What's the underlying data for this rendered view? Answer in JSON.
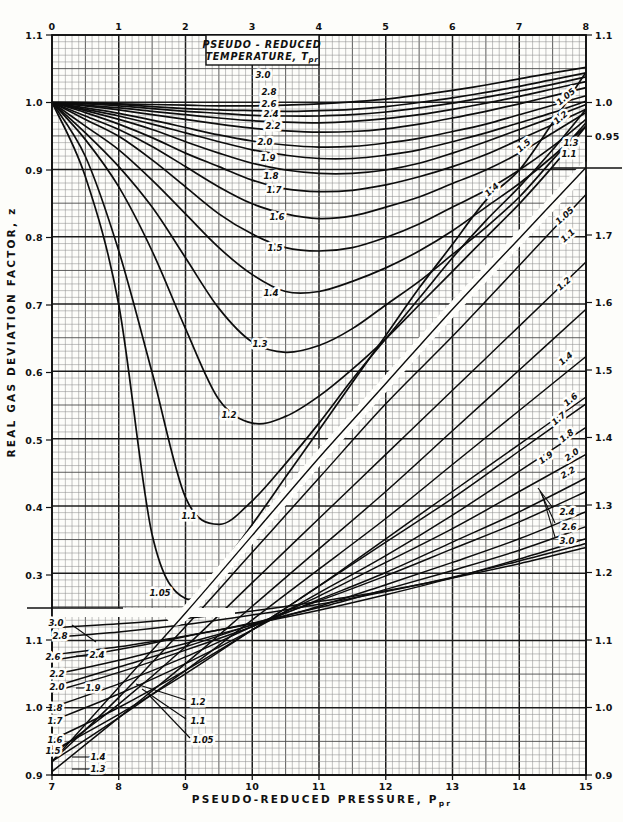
{
  "figure": {
    "x_axis_title": {
      "main": "PSEUDO-REDUCED  PRESSURE,  P",
      "sub": "pr"
    },
    "y_axis_title": "REAL  GAS  DEVIATION  FACTOR,  z",
    "legend_box": {
      "line1": "PSEUDO - REDUCED",
      "line2_main": "TEMPERATURE, T",
      "line2_sub": "pr"
    }
  },
  "axes": {
    "top_ticks": [
      0,
      1,
      2,
      3,
      4,
      5,
      6,
      7,
      8
    ],
    "bottom_ticks": [
      7,
      8,
      9,
      10,
      11,
      12,
      13,
      14,
      15
    ],
    "left_main": [
      1.1,
      1.0,
      0.9,
      0.8,
      0.7,
      0.6,
      0.5,
      0.4,
      0.3
    ],
    "left_insert": [
      1.1,
      1.0,
      0.9
    ],
    "right_main": [
      1.1,
      1.0,
      0.95
    ],
    "right_insert": [
      1.7,
      1.6,
      1.5,
      1.4,
      1.3,
      1.2,
      1.1,
      1.0,
      0.9
    ],
    "main_x_range": [
      0,
      8
    ],
    "insert_x_range": [
      7,
      15
    ],
    "main_z_top": 1.1,
    "insert_z_bottom": 0.9
  },
  "chart_data": [
    {
      "type": "line",
      "name": "main",
      "title": "Real gas deviation factor z vs pseudo-reduced pressure (Ppr 0-8)",
      "x": [
        0,
        0.5,
        1,
        1.5,
        2,
        2.5,
        3,
        3.5,
        4,
        4.5,
        5,
        5.5,
        6,
        6.5,
        7,
        7.5,
        8
      ],
      "series": [
        {
          "name": "3.0",
          "values": [
            1.0,
            1.0,
            0.998,
            0.997,
            0.996,
            0.995,
            0.995,
            0.996,
            0.998,
            1.001,
            1.005,
            1.011,
            1.018,
            1.026,
            1.035,
            1.044,
            1.052
          ]
        },
        {
          "name": "2.8",
          "values": [
            1.0,
            0.999,
            0.997,
            0.994,
            0.991,
            0.989,
            0.988,
            0.987,
            0.988,
            0.99,
            0.994,
            1.0,
            1.007,
            1.015,
            1.024,
            1.034,
            1.044
          ]
        },
        {
          "name": "2.6",
          "values": [
            1.0,
            0.998,
            0.995,
            0.991,
            0.987,
            0.984,
            0.981,
            0.98,
            0.98,
            0.982,
            0.986,
            0.992,
            0.999,
            1.008,
            1.017,
            1.027,
            1.038
          ]
        },
        {
          "name": "2.4",
          "values": [
            1.0,
            0.996,
            0.992,
            0.987,
            0.982,
            0.977,
            0.973,
            0.971,
            0.97,
            0.972,
            0.976,
            0.982,
            0.99,
            0.999,
            1.009,
            1.02,
            1.031
          ]
        },
        {
          "name": "2.2",
          "values": [
            1.0,
            0.995,
            0.989,
            0.982,
            0.975,
            0.968,
            0.962,
            0.958,
            0.956,
            0.957,
            0.961,
            0.968,
            0.977,
            0.987,
            0.998,
            1.01,
            1.022
          ]
        },
        {
          "name": "2.0",
          "values": [
            1.0,
            0.992,
            0.984,
            0.974,
            0.963,
            0.952,
            0.943,
            0.937,
            0.934,
            0.935,
            0.94,
            0.947,
            0.957,
            0.968,
            0.982,
            0.996,
            1.01
          ]
        },
        {
          "name": "1.9",
          "values": [
            1.0,
            0.99,
            0.98,
            0.968,
            0.955,
            0.942,
            0.93,
            0.922,
            0.917,
            0.917,
            0.922,
            0.93,
            0.942,
            0.955,
            0.97,
            0.985,
            1.002
          ]
        },
        {
          "name": "1.8",
          "values": [
            1.0,
            0.988,
            0.975,
            0.96,
            0.942,
            0.925,
            0.91,
            0.9,
            0.895,
            0.895,
            0.9,
            0.91,
            0.925,
            0.942,
            0.96,
            0.978,
            0.997
          ]
        },
        {
          "name": "1.7",
          "values": [
            1.0,
            0.985,
            0.968,
            0.948,
            0.925,
            0.905,
            0.885,
            0.872,
            0.868,
            0.87,
            0.878,
            0.89,
            0.905,
            0.923,
            0.945,
            0.967,
            0.99
          ]
        },
        {
          "name": "1.6",
          "values": [
            1.0,
            0.98,
            0.96,
            0.935,
            0.905,
            0.875,
            0.85,
            0.835,
            0.828,
            0.832,
            0.845,
            0.86,
            0.88,
            0.9,
            0.925,
            0.955,
            0.985
          ]
        },
        {
          "name": "1.5",
          "values": [
            1.0,
            0.975,
            0.95,
            0.915,
            0.875,
            0.835,
            0.805,
            0.785,
            0.78,
            0.785,
            0.8,
            0.82,
            0.845,
            0.87,
            0.9,
            0.935,
            0.975
          ]
        },
        {
          "name": "1.4",
          "values": [
            1.0,
            0.965,
            0.93,
            0.885,
            0.835,
            0.785,
            0.745,
            0.72,
            0.72,
            0.735,
            0.755,
            0.78,
            0.81,
            0.845,
            0.88,
            0.92,
            0.965
          ]
        },
        {
          "name": "1.3",
          "values": [
            1.0,
            0.955,
            0.905,
            0.845,
            0.77,
            0.695,
            0.645,
            0.63,
            0.64,
            0.665,
            0.7,
            0.735,
            0.775,
            0.815,
            0.86,
            0.915,
            0.97
          ]
        },
        {
          "name": "1.2",
          "values": [
            1.0,
            0.945,
            0.875,
            0.78,
            0.665,
            0.56,
            0.525,
            0.535,
            0.565,
            0.605,
            0.65,
            0.7,
            0.75,
            0.8,
            0.85,
            0.905,
            0.965
          ]
        },
        {
          "name": "1.1",
          "values": [
            1.0,
            0.92,
            0.78,
            0.6,
            0.415,
            0.375,
            0.41,
            0.465,
            0.525,
            0.59,
            0.65,
            0.71,
            0.77,
            0.825,
            0.875,
            0.93,
            0.99
          ]
        },
        {
          "name": "1.05",
          "values": [
            1.0,
            0.89,
            0.7,
            0.36,
            0.265,
            0.31,
            0.375,
            0.445,
            0.515,
            0.585,
            0.655,
            0.725,
            0.79,
            0.855,
            0.9,
            0.97,
            1.045
          ]
        }
      ],
      "xlabel": "Pseudo-reduced pressure, Ppr",
      "ylabel": "Real gas deviation factor, z",
      "ylim": [
        0.25,
        1.1
      ],
      "grid": true
    },
    {
      "type": "line",
      "name": "insert",
      "title": "Continuation curves (Ppr 7-15, right-hand z scale)",
      "x": [
        7,
        8,
        9,
        10,
        11,
        12,
        13,
        14,
        15
      ],
      "series": [
        {
          "name": "1.05",
          "values": [
            0.92,
            1.03,
            1.14,
            1.255,
            1.37,
            1.48,
            1.59,
            1.695,
            1.8
          ]
        },
        {
          "name": "1.1",
          "values": [
            0.92,
            1.015,
            1.12,
            1.23,
            1.34,
            1.45,
            1.55,
            1.655,
            1.76
          ]
        },
        {
          "name": "1.2",
          "values": [
            0.93,
            1.005,
            1.09,
            1.185,
            1.28,
            1.375,
            1.47,
            1.565,
            1.66
          ]
        },
        {
          "name": "1.3",
          "values": [
            0.905,
            0.985,
            1.065,
            1.15,
            1.235,
            1.32,
            1.41,
            1.5,
            1.59
          ]
        },
        {
          "name": "1.4",
          "values": [
            0.92,
            0.985,
            1.055,
            1.13,
            1.205,
            1.28,
            1.36,
            1.44,
            1.52
          ]
        },
        {
          "name": "1.5",
          "values": [
            0.935,
            0.99,
            1.05,
            1.115,
            1.18,
            1.25,
            1.32,
            1.39,
            1.46
          ]
        },
        {
          "name": "1.6",
          "values": [
            0.952,
            1.0,
            1.055,
            1.115,
            1.18,
            1.245,
            1.31,
            1.38,
            1.45
          ]
        },
        {
          "name": "1.7",
          "values": [
            0.98,
            1.02,
            1.065,
            1.115,
            1.17,
            1.225,
            1.285,
            1.35,
            1.415
          ]
        },
        {
          "name": "1.8",
          "values": [
            1.0,
            1.035,
            1.075,
            1.12,
            1.165,
            1.215,
            1.265,
            1.32,
            1.375
          ]
        },
        {
          "name": "1.9",
          "values": [
            1.023,
            1.052,
            1.085,
            1.12,
            1.16,
            1.2,
            1.245,
            1.29,
            1.34
          ]
        },
        {
          "name": "2.0",
          "values": [
            1.03,
            1.06,
            1.09,
            1.123,
            1.158,
            1.195,
            1.235,
            1.275,
            1.32
          ]
        },
        {
          "name": "2.2",
          "values": [
            1.048,
            1.07,
            1.095,
            1.122,
            1.15,
            1.182,
            1.215,
            1.25,
            1.29
          ]
        },
        {
          "name": "2.4",
          "values": [
            1.07,
            1.086,
            1.105,
            1.125,
            1.148,
            1.175,
            1.203,
            1.233,
            1.268
          ]
        },
        {
          "name": "2.6",
          "values": [
            1.078,
            1.09,
            1.106,
            1.124,
            1.144,
            1.167,
            1.192,
            1.22,
            1.25
          ]
        },
        {
          "name": "2.8",
          "values": [
            1.104,
            1.112,
            1.123,
            1.137,
            1.153,
            1.172,
            1.193,
            1.217,
            1.243
          ]
        },
        {
          "name": "3.0",
          "values": [
            1.118,
            1.124,
            1.132,
            1.143,
            1.157,
            1.173,
            1.192,
            1.213,
            1.237
          ]
        }
      ],
      "ylim": [
        0.9,
        1.8
      ],
      "grid": true
    }
  ],
  "curve_labels": [
    {
      "t": "3.0",
      "x": 263,
      "y": 75,
      "r": 0
    },
    {
      "t": "2.8",
      "x": 269,
      "y": 92,
      "r": 0
    },
    {
      "t": "2.6",
      "x": 269,
      "y": 104,
      "r": 0
    },
    {
      "t": "2.4",
      "x": 271,
      "y": 114,
      "r": 0
    },
    {
      "t": "2.2",
      "x": 273,
      "y": 126,
      "r": 0
    },
    {
      "t": "2.0",
      "x": 265,
      "y": 142,
      "r": 0
    },
    {
      "t": "1.9",
      "x": 268,
      "y": 158,
      "r": 0
    },
    {
      "t": "1.8",
      "x": 271,
      "y": 176,
      "r": 0
    },
    {
      "t": "1.7",
      "x": 274,
      "y": 190,
      "r": 0
    },
    {
      "t": "1.6",
      "x": 277,
      "y": 217,
      "r": 0
    },
    {
      "t": "1.5",
      "x": 275,
      "y": 248,
      "r": 0
    },
    {
      "t": "1.4",
      "x": 271,
      "y": 293,
      "r": 0
    },
    {
      "t": "1.3",
      "x": 260,
      "y": 344,
      "r": 0
    },
    {
      "t": "1.2",
      "x": 229,
      "y": 415,
      "r": 0
    },
    {
      "t": "1.1",
      "x": 189,
      "y": 516,
      "r": 0
    },
    {
      "t": "1.05",
      "x": 160,
      "y": 593,
      "r": 0
    },
    {
      "t": "1.05",
      "x": 566,
      "y": 97,
      "r": -40
    },
    {
      "t": "1.2",
      "x": 561,
      "y": 118,
      "r": -40
    },
    {
      "t": "1.5",
      "x": 524,
      "y": 146,
      "r": -40
    },
    {
      "t": "1.3",
      "x": 571,
      "y": 143,
      "r": 0
    },
    {
      "t": "1.1",
      "x": 569,
      "y": 154,
      "r": 0
    },
    {
      "t": "1.4",
      "x": 492,
      "y": 190,
      "r": -42
    },
    {
      "t": "1.05",
      "x": 565,
      "y": 216,
      "r": -42
    },
    {
      "t": "1.1",
      "x": 568,
      "y": 236,
      "r": -42
    },
    {
      "t": "1.2",
      "x": 564,
      "y": 284,
      "r": -42
    },
    {
      "t": "1.4",
      "x": 566,
      "y": 359,
      "r": -40
    },
    {
      "t": "1.6",
      "x": 571,
      "y": 400,
      "r": -40
    },
    {
      "t": "1.7",
      "x": 559,
      "y": 419,
      "r": -40
    },
    {
      "t": "1.8",
      "x": 567,
      "y": 436,
      "r": -38
    },
    {
      "t": "1.9",
      "x": 546,
      "y": 458,
      "r": -35
    },
    {
      "t": "2.0",
      "x": 572,
      "y": 455,
      "r": -35
    },
    {
      "t": "2.2",
      "x": 568,
      "y": 473,
      "r": -30
    },
    {
      "t": "2.4",
      "x": 567,
      "y": 512,
      "r": 0
    },
    {
      "t": "2.6",
      "x": 569,
      "y": 527,
      "r": 0
    },
    {
      "t": "3.0",
      "x": 567,
      "y": 541,
      "r": 0
    },
    {
      "t": "3.0",
      "x": 56,
      "y": 623,
      "r": 0
    },
    {
      "t": "2.8",
      "x": 60,
      "y": 636,
      "r": 0
    },
    {
      "t": "2.6",
      "x": 53,
      "y": 657,
      "r": 0
    },
    {
      "t": "2.4",
      "x": 97,
      "y": 655,
      "r": 0
    },
    {
      "t": "2.2",
      "x": 57,
      "y": 674,
      "r": 0
    },
    {
      "t": "2.0",
      "x": 57,
      "y": 687,
      "r": 0
    },
    {
      "t": "1.9",
      "x": 93,
      "y": 688,
      "r": 0
    },
    {
      "t": "1.8",
      "x": 55,
      "y": 708,
      "r": 0
    },
    {
      "t": "1.7",
      "x": 55,
      "y": 721,
      "r": 0
    },
    {
      "t": "1.6",
      "x": 55,
      "y": 740,
      "r": 0
    },
    {
      "t": "1.5",
      "x": 53,
      "y": 751,
      "r": 0
    },
    {
      "t": "1.4",
      "x": 98,
      "y": 757,
      "r": 0
    },
    {
      "t": "1.3",
      "x": 98,
      "y": 769,
      "r": 0
    },
    {
      "t": "1.2",
      "x": 198,
      "y": 702,
      "r": 0
    },
    {
      "t": "1.1",
      "x": 198,
      "y": 721,
      "r": 0
    },
    {
      "t": "1.05",
      "x": 203,
      "y": 740,
      "r": 0
    }
  ],
  "leader_lines": [
    {
      "x1": 136,
      "y1": 684,
      "x2": 186,
      "y2": 700
    },
    {
      "x1": 142,
      "y1": 689,
      "x2": 186,
      "y2": 719
    },
    {
      "x1": 148,
      "y1": 694,
      "x2": 190,
      "y2": 738
    },
    {
      "x1": 72,
      "y1": 757,
      "x2": 90,
      "y2": 757
    },
    {
      "x1": 72,
      "y1": 769,
      "x2": 90,
      "y2": 769
    },
    {
      "x1": 76,
      "y1": 656,
      "x2": 88,
      "y2": 656
    },
    {
      "x1": 76,
      "y1": 688,
      "x2": 86,
      "y2": 688
    },
    {
      "x1": 72,
      "y1": 625,
      "x2": 96,
      "y2": 642
    },
    {
      "x1": 538,
      "y1": 488,
      "x2": 553,
      "y2": 508
    },
    {
      "x1": 540,
      "y1": 491,
      "x2": 555,
      "y2": 523
    },
    {
      "x1": 542,
      "y1": 494,
      "x2": 555,
      "y2": 537
    }
  ]
}
